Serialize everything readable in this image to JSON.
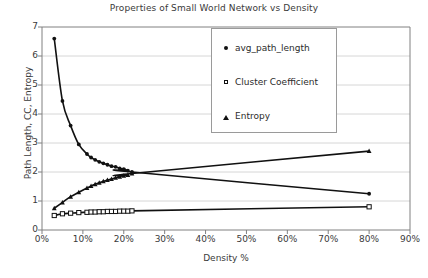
{
  "chart_data": {
    "type": "scatter",
    "title": "Properties of Small World Network vs Density",
    "xlabel": "Density %",
    "ylabel": "Path Length, CC, Entropy",
    "xlim": [
      0,
      90
    ],
    "ylim": [
      0,
      7
    ],
    "xticks": [
      "0%",
      "10%",
      "20%",
      "30%",
      "40%",
      "50%",
      "60%",
      "70%",
      "80%",
      "90%"
    ],
    "xtick_values": [
      0,
      10,
      20,
      30,
      40,
      50,
      60,
      70,
      80,
      90
    ],
    "yticks": [
      "0",
      "1",
      "2",
      "3",
      "4",
      "5",
      "6",
      "7"
    ],
    "ytick_values": [
      0,
      1,
      2,
      3,
      4,
      5,
      6,
      7
    ],
    "grid": "horizontal",
    "legend_position": "upper-center",
    "series": [
      {
        "name": "avg_path_length",
        "marker": "filled-circle",
        "color": "#111111",
        "trendline": true,
        "x": [
          3,
          5,
          7,
          9,
          11,
          12,
          13,
          14,
          15,
          16,
          17,
          18,
          19,
          20,
          21,
          22,
          80
        ],
        "y": [
          6.6,
          4.45,
          3.6,
          2.95,
          2.62,
          2.5,
          2.42,
          2.35,
          2.3,
          2.25,
          2.2,
          2.18,
          2.12,
          2.1,
          2.05,
          2.0,
          1.25
        ]
      },
      {
        "name": "Cluster Coefficient",
        "marker": "open-square",
        "color": "#111111",
        "trendline": true,
        "x": [
          3,
          5,
          7,
          9,
          11,
          12,
          13,
          14,
          15,
          16,
          17,
          18,
          19,
          20,
          21,
          22,
          80
        ],
        "y": [
          0.5,
          0.56,
          0.58,
          0.6,
          0.61,
          0.62,
          0.62,
          0.63,
          0.63,
          0.64,
          0.64,
          0.64,
          0.65,
          0.65,
          0.65,
          0.66,
          0.8
        ]
      },
      {
        "name": "Entropy",
        "marker": "filled-triangle",
        "color": "#111111",
        "trendline": true,
        "x": [
          3,
          5,
          7,
          9,
          11,
          12,
          13,
          14,
          15,
          16,
          17,
          18,
          19,
          20,
          21,
          22,
          80
        ],
        "y": [
          0.75,
          0.95,
          1.15,
          1.3,
          1.45,
          1.52,
          1.58,
          1.63,
          1.68,
          1.72,
          1.76,
          1.8,
          1.84,
          1.87,
          1.9,
          1.95,
          2.72
        ]
      }
    ]
  },
  "legend": {
    "items": [
      {
        "label": "avg_path_length",
        "marker": "filled-circle"
      },
      {
        "label": "Cluster Coefficient",
        "marker": "open-square"
      },
      {
        "label": "Entropy",
        "marker": "filled-triangle"
      }
    ]
  },
  "caption": {
    "text": ""
  }
}
